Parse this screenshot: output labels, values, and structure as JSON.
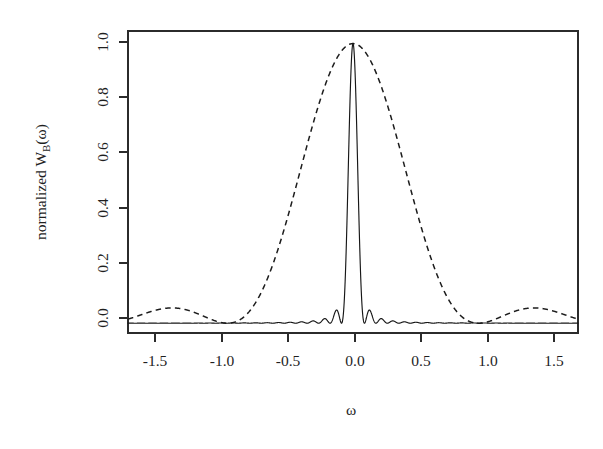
{
  "figure": {
    "background_color": "#ffffff",
    "ink_color": "#1f1f1f",
    "y_axis_title": "normalized W",
    "y_axis_title_sub": "B",
    "y_axis_title_arg": "(ω)",
    "x_axis_title": "ω"
  },
  "chart_data": {
    "type": "line",
    "title": "",
    "subtitle": "",
    "xlabel": "ω",
    "ylabel": "normalized W_B(ω)",
    "xlim": [
      -1.6493,
      1.6493
    ],
    "ylim": [
      -0.035,
      1.045
    ],
    "xticks": [
      -1.5,
      -1.0,
      -0.5,
      0.0,
      0.5,
      1.0,
      1.5
    ],
    "xtick_labels": [
      "-1.5",
      "-1.0",
      "-0.5",
      "0.0",
      "0.5",
      "1.0",
      "1.5"
    ],
    "yticks": [
      0.0,
      0.2,
      0.4,
      0.6,
      0.8,
      1.0
    ],
    "ytick_labels": [
      "0.0",
      "0.2",
      "0.4",
      "0.6",
      "0.8",
      "1.0"
    ],
    "grid": false,
    "legend": null,
    "frame": "box",
    "series": [
      {
        "name": "narrow spectral window",
        "style": "solid",
        "color": "#171717",
        "peak_x": 0.0,
        "peak_y": 1.0,
        "main_lobe_half_width": 0.042,
        "description": "Very narrow central main lobe at omega = 0 reaching 1.0, with small rapidly-oscillating sidelobes (amplitude below 0.08) across the rest of the band.",
        "sidelobe_peaks_x": [
          -0.75,
          -0.6,
          -0.46,
          -0.33,
          -0.21,
          -0.12,
          0.12,
          0.21,
          0.33,
          0.46,
          0.6,
          0.75
        ],
        "sidelobe_peaks_y": [
          0.012,
          0.014,
          0.018,
          0.022,
          0.035,
          0.075,
          0.075,
          0.035,
          0.022,
          0.018,
          0.014,
          0.012
        ]
      },
      {
        "name": "wide spectral window",
        "style": "dashed",
        "color": "#1c1c1c",
        "peak_x": 0.0,
        "peak_y": 1.0,
        "main_lobe_half_width": 0.46,
        "description": "Broad main lobe centred at omega = 0 reaching 1.0, first null near |omega| = 0.46, sidelobes peaking near |omega| = 0.84 at about 0.075 and near |omega| = 1.45 at about 0.03.",
        "sidelobe_peaks_x": [
          -1.45,
          -0.84,
          0.84,
          1.45
        ],
        "sidelobe_peaks_y": [
          0.03,
          0.075,
          0.075,
          0.03
        ]
      }
    ]
  }
}
